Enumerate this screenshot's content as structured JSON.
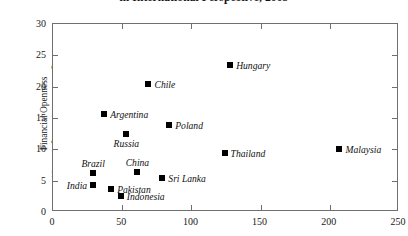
{
  "chart_data": {
    "type": "scatter",
    "title": "in International Perspective, 2005",
    "xlabel": "",
    "ylabel": "Financial Openness (Gross inflows plus gross outflows; in percent of GDP)",
    "ylabel_line1": "Financial Openness",
    "ylabel_line2": "(Gross inflows plus gross outflows;",
    "ylabel_line3": "in percent of GDP)",
    "xlim": [
      0,
      250
    ],
    "ylim": [
      0,
      30
    ],
    "xticks": [
      0,
      50,
      100,
      150,
      200,
      250
    ],
    "yticks": [
      0,
      5,
      10,
      15,
      20,
      25,
      30
    ],
    "xtick_labels": [
      "0",
      "50",
      "100",
      "150",
      "200",
      "250"
    ],
    "ytick_labels": [
      "0",
      "5",
      "10",
      "15",
      "20",
      "25",
      "30"
    ],
    "grid": false,
    "legend": "none",
    "marker_color": "#000000",
    "frame_color": "#6f6f6f",
    "points": [
      {
        "label": "Hungary",
        "x": 128,
        "y": 23.5,
        "label_pos": "right"
      },
      {
        "label": "Chile",
        "x": 69,
        "y": 20.4,
        "label_pos": "right"
      },
      {
        "label": "Argentina",
        "x": 37,
        "y": 15.6,
        "label_pos": "right"
      },
      {
        "label": "Poland",
        "x": 84,
        "y": 13.9,
        "label_pos": "right"
      },
      {
        "label": "Russia",
        "x": 53,
        "y": 12.4,
        "label_pos": "below"
      },
      {
        "label": "Malaysia",
        "x": 207,
        "y": 10.0,
        "label_pos": "right"
      },
      {
        "label": "Thailand",
        "x": 124,
        "y": 9.4,
        "label_pos": "right"
      },
      {
        "label": "China",
        "x": 61,
        "y": 6.4,
        "label_pos": "above"
      },
      {
        "label": "Brazil",
        "x": 29,
        "y": 6.2,
        "label_pos": "above"
      },
      {
        "label": "Sri Lanka",
        "x": 79,
        "y": 5.4,
        "label_pos": "right"
      },
      {
        "label": "India",
        "x": 29,
        "y": 4.3,
        "label_pos": "left"
      },
      {
        "label": "Pakistan",
        "x": 42,
        "y": 3.6,
        "label_pos": "right"
      },
      {
        "label": "Indonesia",
        "x": 49,
        "y": 2.5,
        "label_pos": "right"
      }
    ]
  }
}
